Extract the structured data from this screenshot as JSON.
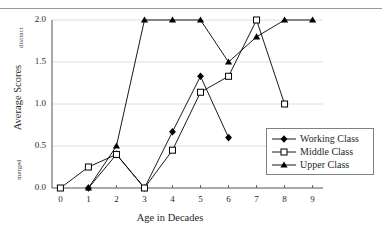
{
  "figure": {
    "cropped_header_text": "",
    "ylabel_top": "distinct",
    "ylabel_bottom": "merged"
  },
  "legend": {
    "position": "inside-right-lower",
    "entries": [
      {
        "label": "Working Class",
        "marker": "filled-diamond",
        "color": "#000000"
      },
      {
        "label": "Middle Class",
        "marker": "open-square",
        "color": "#000000"
      },
      {
        "label": "Upper Class",
        "marker": "filled-triangle",
        "color": "#000000"
      }
    ]
  },
  "chart_data": {
    "type": "line",
    "title": "",
    "xlabel": "Age in Decades",
    "ylabel": "Average Scores",
    "x": [
      0,
      1,
      2,
      3,
      4,
      5,
      6,
      7,
      8,
      9
    ],
    "xlim": [
      -0.3,
      9.3
    ],
    "ylim": [
      0.0,
      2.0
    ],
    "xticks": [
      "0",
      "1",
      "2",
      "3",
      "4",
      "5",
      "6",
      "7",
      "8",
      "9"
    ],
    "yticks": [
      "0.0",
      "0.5",
      "1.0",
      "1.5",
      "2.0"
    ],
    "ytick_values": [
      0.0,
      0.5,
      1.0,
      1.5,
      2.0
    ],
    "y_axis_annotations": {
      "0.0": "merged",
      "2.0": "distinct"
    },
    "grid": "horizontal",
    "series": [
      {
        "name": "Working Class",
        "marker": "filled-diamond",
        "color": "#000000",
        "x": [
          1,
          2,
          3,
          4,
          5,
          6
        ],
        "values": [
          0.0,
          0.4,
          0.0,
          0.67,
          1.33,
          0.6
        ]
      },
      {
        "name": "Middle Class",
        "marker": "open-square",
        "color": "#000000",
        "x": [
          0,
          1,
          2,
          3,
          4,
          5,
          6,
          7,
          8
        ],
        "values": [
          0.0,
          0.25,
          0.4,
          0.0,
          0.45,
          1.14,
          1.33,
          2.0,
          1.0
        ]
      },
      {
        "name": "Upper Class",
        "marker": "filled-triangle",
        "color": "#000000",
        "x": [
          1,
          2,
          3,
          4,
          5,
          6,
          7,
          8,
          9
        ],
        "values": [
          0.0,
          0.5,
          2.0,
          2.0,
          2.0,
          1.5,
          1.8,
          2.0,
          2.0
        ]
      }
    ]
  }
}
